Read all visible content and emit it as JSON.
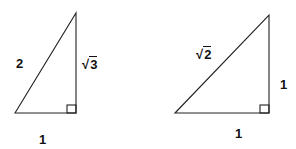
{
  "diagram": {
    "triangles": [
      {
        "name": "30-60-90 triangle",
        "labels": {
          "hypotenuse": "2",
          "vertical_leg_radical": "3",
          "vertical_leg_symbol": "√",
          "base": "1"
        },
        "right_angle": true
      },
      {
        "name": "45-45-90 triangle",
        "labels": {
          "hypotenuse_radical": "2",
          "hypotenuse_symbol": "√",
          "vertical_leg": "1",
          "base": "1"
        },
        "right_angle": true
      }
    ],
    "stroke_color": "#222222"
  }
}
